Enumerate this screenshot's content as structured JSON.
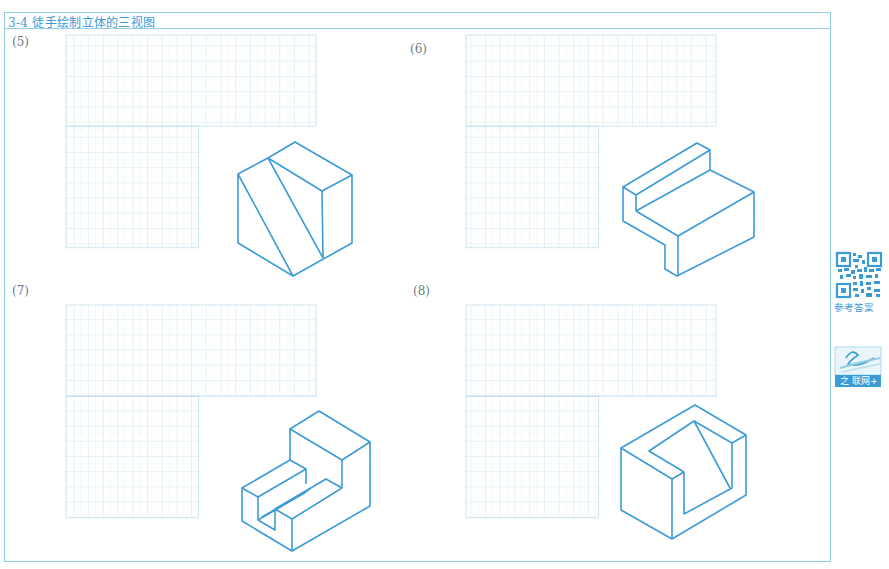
{
  "page": {
    "title": "3-4 徒手绘制立体的三视图"
  },
  "exercises": [
    {
      "label": "(5)",
      "description": "hexagonal-outline isometric block with two diagonal cut lines"
    },
    {
      "label": "(6)",
      "description": "L-shaped block with raised rear wall"
    },
    {
      "label": "(7)",
      "description": "stepped block with slot"
    },
    {
      "label": "(8)",
      "description": "box with corner notch and inclined face"
    }
  ],
  "sidebar": {
    "qr_caption": "参考答案",
    "logo_text": "之 联网+"
  },
  "colors": {
    "accent": "#3a9bd6",
    "frame": "#8fcde0",
    "grid": "#b8d9ec",
    "grid_dotted": "#d3e7f3",
    "label": "#6a7884"
  },
  "grid": {
    "cell_w": 14.7,
    "cell_h": 15.2,
    "top_cols": 17,
    "top_rows": 6,
    "bottom_cols": 9,
    "bottom_rows": 8
  }
}
